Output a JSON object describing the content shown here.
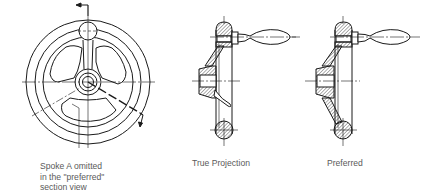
{
  "figure": {
    "type": "engineering-drawing"
  },
  "views": [
    {
      "id": "front-view",
      "caption_lines": [
        "Spoke A omitted",
        "in the \"preferred\"",
        "section view"
      ]
    },
    {
      "id": "true-projection",
      "caption_lines": [
        "True Projection"
      ]
    },
    {
      "id": "preferred",
      "caption_lines": [
        "Preferred"
      ]
    }
  ],
  "colors": {
    "line": "#1a1a1a",
    "hatch": "#333333",
    "caption": "#5a5a5a",
    "background": "#ffffff"
  }
}
